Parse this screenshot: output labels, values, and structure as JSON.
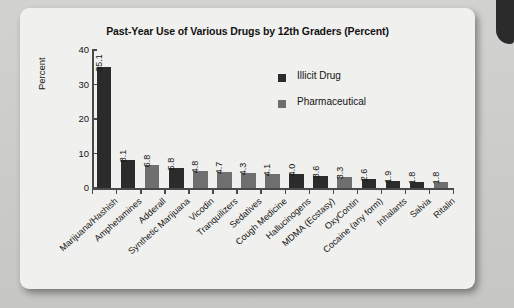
{
  "figure": {
    "y_axis_title": "Percent",
    "legend_position": "inside-top-right"
  },
  "chart_data": {
    "type": "bar",
    "title": "Past-Year Use of Various Drugs by 12th Graders (Percent)",
    "xlabel": "",
    "ylabel": "Percent",
    "ylim": [
      0,
      40
    ],
    "yticks": [
      "0",
      "10",
      "20",
      "30",
      "40"
    ],
    "grid": false,
    "legend": [
      {
        "name": "Illicit Drug",
        "color": "#2b2b2b"
      },
      {
        "name": "Pharmaceutical",
        "color": "#6f6f6f"
      }
    ],
    "categories": [
      "Marijuana/Hashish",
      "Amphetamines",
      "Adderall",
      "Synthetic Marijuana",
      "Vicodin",
      "Tranquilizers",
      "Sedatives",
      "Cough Medicine",
      "Hallucinogens",
      "MDMA (Ecstasy)",
      "OxyContin",
      "Cocaine (any form)",
      "Inhalants",
      "Salvia",
      "Ritalin"
    ],
    "values": [
      35.1,
      8.1,
      6.8,
      5.8,
      4.8,
      4.7,
      4.3,
      4.1,
      4.0,
      3.6,
      3.3,
      2.6,
      1.9,
      1.8,
      1.8
    ],
    "value_labels": [
      "35.1",
      "8.1",
      "6.8",
      "5.8",
      "4.8",
      "4.7",
      "4.3",
      "4.1",
      "4.0",
      "3.6",
      "3.3",
      "2.6",
      "1.9",
      "1.8",
      "1.8"
    ],
    "series_of_bar": [
      "Illicit Drug",
      "Illicit Drug",
      "Pharmaceutical",
      "Illicit Drug",
      "Pharmaceutical",
      "Pharmaceutical",
      "Pharmaceutical",
      "Pharmaceutical",
      "Illicit Drug",
      "Illicit Drug",
      "Pharmaceutical",
      "Illicit Drug",
      "Illicit Drug",
      "Illicit Drug",
      "Pharmaceutical"
    ]
  }
}
